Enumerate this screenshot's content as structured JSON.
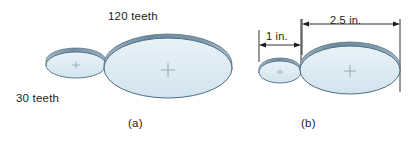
{
  "figure": {
    "background_color": "#ffffff",
    "gear_face_color": "#dbe8f1",
    "gear_face_color_light": "#e6f0f6",
    "gear_rim_color": "#7d96a8",
    "gear_outline_color": "#4f6c80",
    "center_mark_color": "#8fa3b3",
    "dimension_line_color": "#1c1c1c",
    "text_color": "#1c1c1c"
  },
  "part_a": {
    "caption": "(a)",
    "small_gear_label": "30 teeth",
    "large_gear_label": "120 teeth",
    "small_gear": {
      "teeth": 30,
      "center_mark": "+"
    },
    "large_gear": {
      "teeth": 120,
      "center_mark": "+"
    }
  },
  "part_b": {
    "caption": "(b)",
    "small_gear_dimension": "1 in.",
    "large_gear_dimension": "2.5 in.",
    "small_gear": {
      "diameter_in": 1,
      "center_mark": "+"
    },
    "large_gear": {
      "diameter_in": 2.5,
      "center_mark": "+"
    }
  }
}
